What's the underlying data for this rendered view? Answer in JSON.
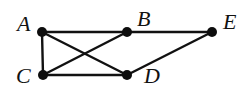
{
  "diagram": {
    "type": "graph",
    "nodes": [
      {
        "id": "A",
        "label": "A",
        "x": 42,
        "y": 32,
        "label_x": 17,
        "label_y": 31
      },
      {
        "id": "B",
        "label": "B",
        "x": 127,
        "y": 32,
        "label_x": 137,
        "label_y": 26
      },
      {
        "id": "E",
        "label": "E",
        "x": 212,
        "y": 32,
        "label_x": 223,
        "label_y": 29
      },
      {
        "id": "C",
        "label": "C",
        "x": 43,
        "y": 75,
        "label_x": 16,
        "label_y": 83
      },
      {
        "id": "D",
        "label": "D",
        "x": 127,
        "y": 75,
        "label_x": 144,
        "label_y": 83
      }
    ],
    "edges": [
      {
        "from": "A",
        "to": "B"
      },
      {
        "from": "B",
        "to": "E"
      },
      {
        "from": "A",
        "to": "C"
      },
      {
        "from": "A",
        "to": "D"
      },
      {
        "from": "C",
        "to": "B"
      },
      {
        "from": "C",
        "to": "D"
      },
      {
        "from": "D",
        "to": "E"
      }
    ],
    "colors": {
      "edge": "#111111",
      "node": "#0d0d0d",
      "background": "#ffffff"
    }
  }
}
